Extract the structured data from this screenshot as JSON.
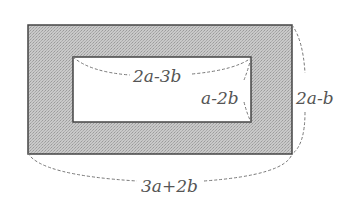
{
  "diagram": {
    "type": "rectangular frame (shaded border region between two rectangles)",
    "outer_rect": {
      "x": 28,
      "y": 25,
      "width": 264,
      "height": 129
    },
    "inner_rect": {
      "x": 73,
      "y": 57,
      "width": 178,
      "height": 65
    },
    "fill_color": "#bdbdbd",
    "stroke_color": "#444444",
    "labels": {
      "inner_width": "2a-3b",
      "inner_height": "a-2b",
      "outer_height": "2a-b",
      "outer_width": "3a+2b"
    }
  }
}
